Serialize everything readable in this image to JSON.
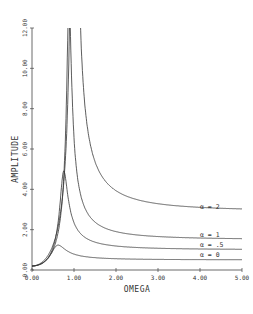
{
  "chart_data": {
    "type": "line",
    "title": "",
    "xlabel": "OMEGA",
    "ylabel": "AMPLITUDE",
    "xlim": [
      0,
      5
    ],
    "ylim": [
      0,
      12
    ],
    "grid": false,
    "x_ticks": [
      "0.00",
      "1.00",
      "2.00",
      "3.00",
      "4.00",
      "5.00"
    ],
    "y_ticks": [
      "0.00",
      "2.00",
      "4.00",
      "6.00",
      "8.00",
      "10.00",
      "12.00"
    ],
    "legend_position": "inline-right",
    "series": [
      {
        "name": "α = 0",
        "label": "α = 0",
        "peak_omega": 0.6,
        "peak_amplitude": 2.1,
        "asymptote": 0.5
      },
      {
        "name": "α = .5",
        "label": "α = .5",
        "peak_omega": 0.75,
        "peak_amplitude": 4.9,
        "asymptote": 1.0
      },
      {
        "name": "α = 1",
        "label": "α = 1",
        "peak_omega": 0.88,
        "peak_amplitude": 9.4,
        "asymptote": 1.5
      },
      {
        "name": "α = 2",
        "label": "α = 2",
        "peak_omega": 1.0,
        "peak_amplitude": 12.0,
        "asymptote": 2.9
      }
    ]
  }
}
